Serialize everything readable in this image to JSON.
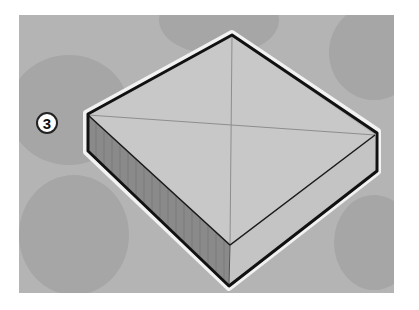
{
  "figure": {
    "step_badge": "3",
    "colors": {
      "page_background": "#ffffff",
      "panel_background": "#b4b4b4",
      "blob": "#a6a6a6",
      "top_face": "#c8c8c8",
      "left_side": "#8a8a8a",
      "right_side": "#c4c4c4",
      "edge": "#111111",
      "halo": "#f2f2f2",
      "diagonal": "#8e8e8e"
    }
  }
}
